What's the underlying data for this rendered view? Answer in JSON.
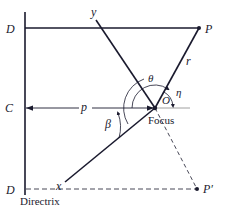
{
  "diagram": {
    "labels": {
      "D_top": "D",
      "C": "C",
      "D_bottom": "D",
      "y": "y",
      "P": "P",
      "r": "r",
      "theta": "θ",
      "eta": "η",
      "O": "O",
      "p": "p",
      "beta": "β",
      "focus": "Focus",
      "x": "x",
      "P_prime": "P′",
      "directrix": "Directrix"
    },
    "colors": {
      "line": "#1a1a2e",
      "dashed": "#333344",
      "background": "#ffffff"
    }
  }
}
